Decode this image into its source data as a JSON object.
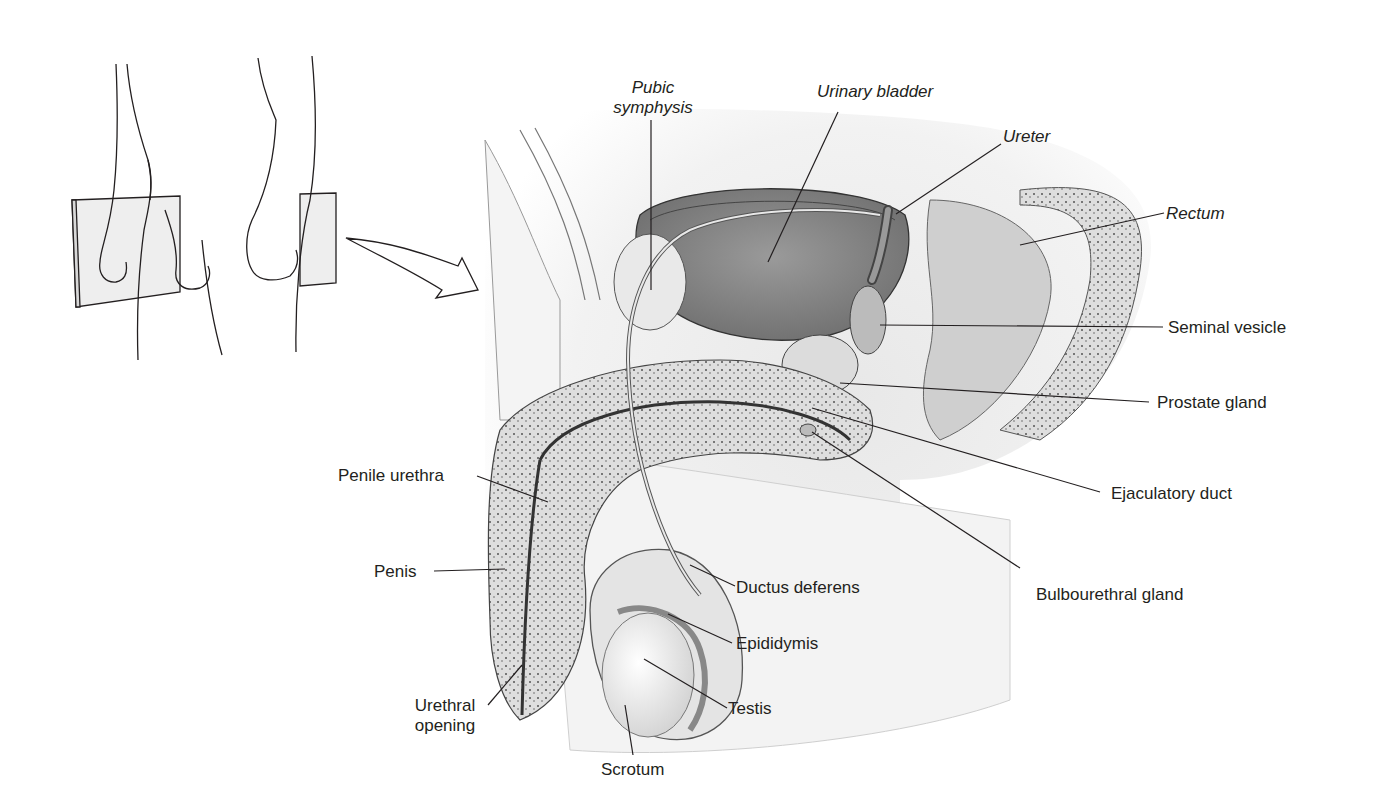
{
  "figure": {
    "inset": "side-view orientation sketch with plane-of-section card and arrow"
  },
  "labels": {
    "pubic_symphysis_1": "Pubic",
    "pubic_symphysis_2": "symphysis",
    "urinary_bladder": "Urinary bladder",
    "ureter": "Ureter",
    "rectum": "Rectum",
    "seminal_vesicle": "Seminal vesicle",
    "prostate_gland": "Prostate gland",
    "ejaculatory_duct": "Ejaculatory duct",
    "bulbourethral_gland": "Bulbourethral gland",
    "penile_urethra": "Penile urethra",
    "penis": "Penis",
    "urethral_opening_1": "Urethral",
    "urethral_opening_2": "opening",
    "scrotum": "Scrotum",
    "testis": "Testis",
    "epididymis": "Epididymis",
    "ductus_deferens": "Ductus deferens"
  },
  "colors": {
    "line": "#231f20",
    "tissue_shade": "#bdbdbd",
    "tissue_light": "#e6e6e6",
    "card": "#eeeeee"
  }
}
